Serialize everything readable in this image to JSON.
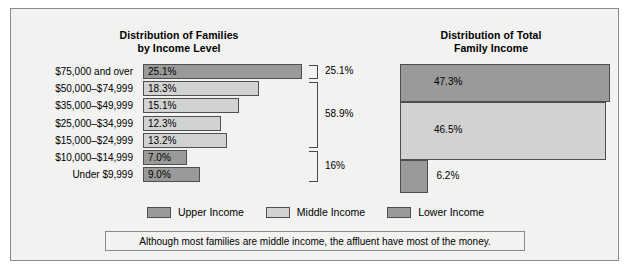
{
  "figure": {
    "background_color": "#f2f2f0",
    "border_color": "#8a8a8a"
  },
  "colors": {
    "upper_income": "#9a9a9a",
    "middle_income": "#d2d2d2",
    "lower_income": "#9a9a9a",
    "bar_outline": "#4f4f4f"
  },
  "left_chart": {
    "title_line1": "Distribution of Families",
    "title_line2": "by Income Level"
  },
  "right_chart": {
    "title_line1": "Distribution of Total",
    "title_line2": "Family Income"
  },
  "brackets": [
    {
      "label": "25.1%",
      "group": "upper"
    },
    {
      "label": "58.9%",
      "group": "middle"
    },
    {
      "label": "16%",
      "group": "lower"
    }
  ],
  "legend": [
    {
      "label": "Upper Income",
      "color": "#9a9a9a"
    },
    {
      "label": "Middle Income",
      "color": "#d2d2d2"
    },
    {
      "label": "Lower Income",
      "color": "#9a9a9a"
    }
  ],
  "caption": "Although most families are middle income, the affluent have most of the money.",
  "chart_data": [
    {
      "type": "bar",
      "orientation": "horizontal",
      "title": "Distribution of Families by Income Level",
      "xlabel": "",
      "ylabel": "",
      "xlim": [
        0,
        27
      ],
      "grid": false,
      "legend_position": "bottom-center",
      "categories": [
        "$75,000 and over",
        "$50,000–$74,999",
        "$35,000–$49,999",
        "$25,000–$34,999",
        "$15,000–$24,999",
        "$10,000–$14,999",
        "Under $9,999"
      ],
      "values": [
        25.1,
        18.3,
        15.1,
        12.3,
        13.2,
        7.0,
        9.0
      ],
      "value_labels": [
        "25.1%",
        "18.3%",
        "15.1%",
        "12.3%",
        "13.2%",
        "7.0%",
        "9.0%"
      ],
      "group_of_category": [
        "upper",
        "middle",
        "middle",
        "middle",
        "middle",
        "lower",
        "lower"
      ],
      "annotations": [
        {
          "text": "25.1%",
          "covers": [
            "$75,000 and over"
          ]
        },
        {
          "text": "58.9%",
          "covers": [
            "$50,000–$74,999",
            "$35,000–$49,999",
            "$25,000–$34,999",
            "$15,000–$24,999"
          ]
        },
        {
          "text": "16%",
          "covers": [
            "$10,000–$14,999",
            "Under $9,999"
          ]
        }
      ]
    },
    {
      "type": "bar",
      "orientation": "horizontal",
      "title": "Distribution of Total Family Income",
      "xlabel": "",
      "ylabel": "",
      "xlim": [
        0,
        50
      ],
      "grid": false,
      "categories": [
        "Upper Income",
        "Middle Income",
        "Lower Income"
      ],
      "values": [
        47.3,
        46.5,
        6.2
      ],
      "value_labels": [
        "47.3%",
        "46.5%",
        "6.2%"
      ]
    }
  ]
}
